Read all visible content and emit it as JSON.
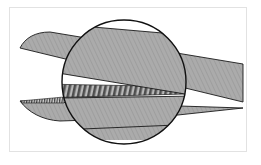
{
  "illustration": {
    "subject": "Scissor blades with magnified detail circle showing serrated blade edge",
    "colors": {
      "background": "#ffffff",
      "frame_border": "#e2e2e2",
      "blade_fill": "#a9a9a9",
      "blade_hatch": "#8a8a8a",
      "serration_dark": "#555555",
      "serration_light": "#b8b8b8",
      "outline": "#1a1a1a"
    },
    "magnifier": {
      "cx": 124,
      "cy": 82,
      "r": 62
    }
  }
}
